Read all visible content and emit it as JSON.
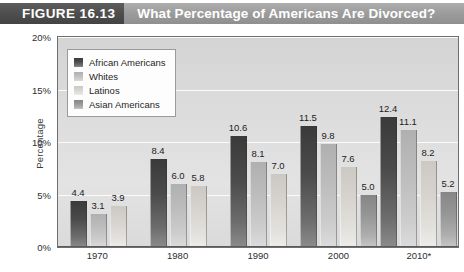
{
  "header": {
    "figure_number": "FIGURE 16.13",
    "title": "What Percentage of Americans Are Divorced?"
  },
  "chart_data": {
    "type": "bar",
    "title": "What Percentage of Americans Are Divorced?",
    "xlabel": "",
    "ylabel": "Percentage",
    "categories": [
      "1970",
      "1980",
      "1990",
      "2000",
      "2010*"
    ],
    "ylim": [
      0,
      20
    ],
    "yticks": [
      "0%",
      "5%",
      "10%",
      "15%",
      "20%"
    ],
    "ytick_values": [
      0,
      5,
      10,
      15,
      20
    ],
    "grid": true,
    "legend_position": "top-left",
    "series": [
      {
        "name": "African Americans",
        "color": "#4b4b4b",
        "values": [
          4.4,
          8.4,
          10.6,
          11.5,
          12.4
        ],
        "labels": [
          "4.4",
          "8.4",
          "10.6",
          "11.5",
          "12.4"
        ]
      },
      {
        "name": "Whites",
        "color": "#bdbdbd",
        "values": [
          3.1,
          6.0,
          8.1,
          9.8,
          11.1
        ],
        "labels": [
          "3.1",
          "6.0",
          "8.1",
          "9.8",
          "11.1"
        ]
      },
      {
        "name": "Latinos",
        "color": "#d7d4cf",
        "values": [
          3.9,
          5.8,
          7.0,
          7.6,
          8.2
        ],
        "labels": [
          "3.9",
          "5.8",
          "7.0",
          "7.6",
          "8.2"
        ]
      },
      {
        "name": "Asian Americans",
        "color": "#969696",
        "values": [
          null,
          null,
          null,
          5.0,
          5.2
        ],
        "labels": [
          "",
          "",
          "",
          "5.0",
          "5.2"
        ]
      }
    ]
  }
}
